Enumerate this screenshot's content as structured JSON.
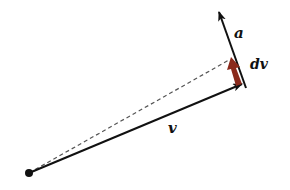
{
  "diagram": {
    "title": "",
    "labels": {
      "velocity": "v",
      "acceleration": "a",
      "velocity_change": "dv"
    },
    "colors": {
      "vector": "#111111",
      "dashed": "#555555",
      "dv_arrow": "#8a2a1c",
      "background": "#ffffff"
    },
    "geometry": {
      "origin": [
        29,
        173
      ],
      "v_tip": [
        243,
        84
      ],
      "a_start": [
        246,
        88
      ],
      "a_tip": [
        218,
        10
      ],
      "dv_start": [
        238,
        85
      ],
      "dv_tip": [
        231,
        59
      ],
      "dashed_end": [
        229,
        59
      ]
    }
  }
}
